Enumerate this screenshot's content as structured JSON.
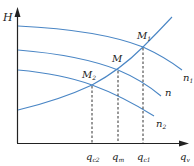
{
  "diagram": {
    "title": "",
    "axes": {
      "y_label": "H",
      "x_label_main": "q",
      "x_label_sub": "v"
    },
    "curves": {
      "n1": {
        "label_main": "n",
        "label_sub": "1"
      },
      "n": {
        "label_main": "n",
        "label_sub": ""
      },
      "n2": {
        "label_main": "n",
        "label_sub": "2"
      }
    },
    "points": {
      "M1": {
        "label_main": "M",
        "label_sub": "1"
      },
      "M": {
        "label_main": "M",
        "label_sub": ""
      },
      "M2": {
        "label_main": "M",
        "label_sub": "2"
      }
    },
    "x_ticks": [
      {
        "main": "q",
        "sub": "c2"
      },
      {
        "main": "q",
        "sub": "m"
      },
      {
        "main": "q",
        "sub": "c1"
      }
    ],
    "colors": {
      "curve": "#4a86c5",
      "axis": "#222222",
      "dashed": "#333333"
    }
  }
}
